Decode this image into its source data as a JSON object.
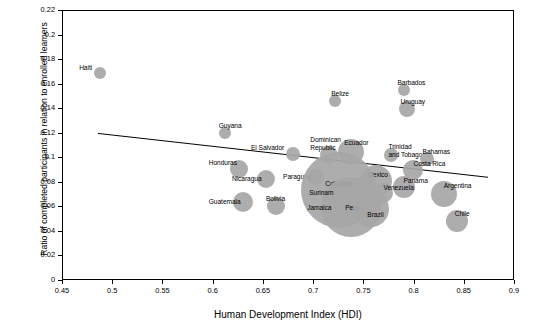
{
  "chart_data": {
    "type": "scatter",
    "title": "",
    "subtitle": "",
    "xlabel": "Human Development Index (HDI)",
    "ylabel": "Ratio of completed participants in relation to enrolled learners",
    "xlim": [
      0.45,
      0.9
    ],
    "ylim": [
      0,
      0.22
    ],
    "xticks": [
      "0.45",
      "0.5",
      "0.55",
      "0.6",
      "0.65",
      "0.7",
      "0.75",
      "0.8",
      "0.85",
      "0.9"
    ],
    "yticks": [
      "0",
      "0.02",
      "0.04",
      "0.06",
      "0.08",
      "0.1",
      "0.12",
      "0.14",
      "0.16",
      "0.18",
      "0.2",
      "0.22"
    ],
    "grid": false,
    "legend": "none",
    "bubble_color": "#a6a6a6",
    "trendline": {
      "x0": 0.485,
      "y0": 0.1195,
      "x1": 0.875,
      "y1": 0.0835
    },
    "points": [
      {
        "label": "Haiti",
        "x": 0.487,
        "y": 0.1695,
        "size": 6,
        "label_dx": -21,
        "label_dy": -9
      },
      {
        "label": "Guyana",
        "x": 0.611,
        "y": 0.1205,
        "size": 6,
        "label_dx": -6,
        "label_dy": -11
      },
      {
        "label": "Belize",
        "x": 0.721,
        "y": 0.1465,
        "size": 6,
        "label_dx": -4,
        "label_dy": -11
      },
      {
        "label": "Barbados",
        "x": 0.789,
        "y": 0.1555,
        "size": 6,
        "label_dx": -6,
        "label_dy": -11
      },
      {
        "label": "Uruguay",
        "x": 0.792,
        "y": 0.1405,
        "size": 8,
        "label_dx": -6,
        "label_dy": -11
      },
      {
        "label": "El Salvador",
        "x": 0.679,
        "y": 0.1035,
        "size": 7,
        "label_dx": -42,
        "label_dy": -10
      },
      {
        "label": "Dominican Republic",
        "x": 0.715,
        "y": 0.1025,
        "size": 9,
        "label_dx": -19,
        "label_dy": -19
      },
      {
        "label": "Ecuador",
        "x": 0.737,
        "y": 0.1055,
        "size": 13,
        "label_dx": -7,
        "label_dy": -13
      },
      {
        "label": "Trinidad and Tobago",
        "x": 0.777,
        "y": 0.1025,
        "size": 7,
        "label_dx": -3,
        "label_dy": -12
      },
      {
        "label": "Bahamas",
        "x": 0.812,
        "y": 0.0995,
        "size": 7,
        "label_dx": -4,
        "label_dy": -11
      },
      {
        "label": "Costa Rica",
        "x": 0.798,
        "y": 0.0905,
        "size": 10,
        "label_dx": 1,
        "label_dy": -10
      },
      {
        "label": "Honduras",
        "x": 0.625,
        "y": 0.0915,
        "size": 9,
        "label_dx": -30,
        "label_dy": -10
      },
      {
        "label": "Nicaragua",
        "x": 0.652,
        "y": 0.0835,
        "size": 9,
        "label_dx": -34,
        "label_dy": -4
      },
      {
        "label": "Paraguay",
        "x": 0.702,
        "y": 0.0845,
        "size": 8,
        "label_dx": -33,
        "label_dy": -4
      },
      {
        "label": "Mexico",
        "x": 0.762,
        "y": 0.0815,
        "size": 16,
        "label_dx": -9,
        "label_dy": -10
      },
      {
        "label": "Panama",
        "x": 0.789,
        "y": 0.0765,
        "size": 11,
        "label_dx": 0,
        "label_dy": -10
      },
      {
        "label": "Venezuela",
        "x": 0.769,
        "y": 0.0715,
        "size": 10,
        "label_dx": 0,
        "label_dy": -9
      },
      {
        "label": "Argentina",
        "x": 0.829,
        "y": 0.0705,
        "size": 13,
        "label_dx": 0,
        "label_dy": -12
      },
      {
        "label": "Colombia",
        "x": 0.725,
        "y": 0.0745,
        "size": 38,
        "label_dx": -14,
        "label_dy": -10
      },
      {
        "label": "Peru",
        "x": 0.737,
        "y": 0.0605,
        "size": 30,
        "label_dx": -6,
        "label_dy": -3
      },
      {
        "label": "Brazil",
        "x": 0.757,
        "y": 0.0585,
        "size": 18,
        "label_dx": -4,
        "label_dy": 2
      },
      {
        "label": "Surinam",
        "x": 0.716,
        "y": 0.0675,
        "size": 8,
        "label_dx": -21,
        "label_dy": -9
      },
      {
        "label": "Jamaica",
        "x": 0.715,
        "y": 0.0615,
        "size": 8,
        "label_dx": -22,
        "label_dy": -2
      },
      {
        "label": "Guatemala",
        "x": 0.629,
        "y": 0.0645,
        "size": 10,
        "label_dx": -34,
        "label_dy": -4
      },
      {
        "label": "Bolivia",
        "x": 0.662,
        "y": 0.0615,
        "size": 9,
        "label_dx": -10,
        "label_dy": -11
      },
      {
        "label": "Chile",
        "x": 0.842,
        "y": 0.0485,
        "size": 11,
        "label_dx": -2,
        "label_dy": -11
      }
    ]
  }
}
